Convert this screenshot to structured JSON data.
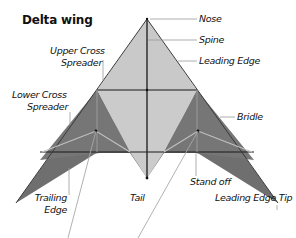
{
  "title": "Delta wing",
  "labels": {
    "nose": "Nose",
    "spine": "Spine",
    "leading_edge": "Leading Edge",
    "upper_cross_spreader_1": "Upper Cross",
    "upper_cross_spreader_2": "Spreader",
    "lower_cross_spreader_1": "Lower Cross",
    "lower_cross_spreader_2": "Spreader",
    "bridle": "Bridle",
    "trailing_edge_1": "Trailing",
    "trailing_edge_2": "Edge",
    "tail": "Tail",
    "stand_off": "Stand off",
    "leading_edge_tip": "Leading Edge Tip"
  },
  "colors": {
    "sail_light": "#c8c8c8",
    "sail_dark": "#6e6e6e",
    "spar": "#1a1a1a",
    "leader_line": "#9a9a9a",
    "bridle_line": "#bdbdbd"
  }
}
